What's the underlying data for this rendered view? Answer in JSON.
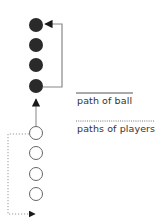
{
  "diagram": {
    "colors": {
      "ball_path": "#888888",
      "player_path": "#999999",
      "filled_circle": "#2a2a2a",
      "open_circle": "#666666",
      "text": "#333333"
    },
    "filled_circles": [
      {
        "cx": 36,
        "cy": 25
      },
      {
        "cx": 36,
        "cy": 45
      },
      {
        "cx": 36,
        "cy": 65
      },
      {
        "cx": 36,
        "cy": 86
      }
    ],
    "open_circles": [
      {
        "cx": 36,
        "cy": 133
      },
      {
        "cx": 36,
        "cy": 153
      },
      {
        "cx": 36,
        "cy": 174
      },
      {
        "cx": 36,
        "cy": 194
      }
    ]
  },
  "legend": {
    "ball_label": "path of ball",
    "players_label": "paths of players"
  }
}
